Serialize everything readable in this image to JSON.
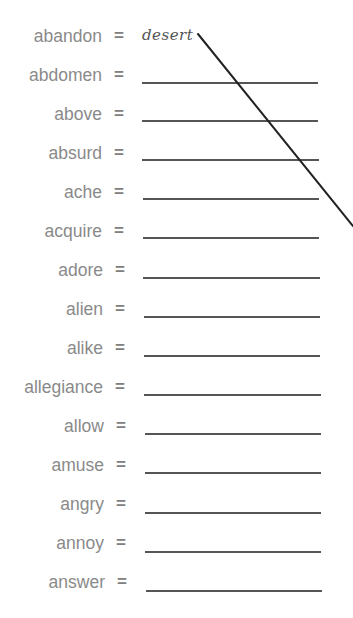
{
  "worksheet": {
    "title_cut": "",
    "separator": "=",
    "rows": [
      {
        "word": "abandon",
        "answer": "desert"
      },
      {
        "word": "abdomen",
        "answer": ""
      },
      {
        "word": "above",
        "answer": ""
      },
      {
        "word": "absurd",
        "answer": ""
      },
      {
        "word": "ache",
        "answer": ""
      },
      {
        "word": "acquire",
        "answer": ""
      },
      {
        "word": "adore",
        "answer": ""
      },
      {
        "word": "alien",
        "answer": ""
      },
      {
        "word": "alike",
        "answer": ""
      },
      {
        "word": "allegiance",
        "answer": ""
      },
      {
        "word": "allow",
        "answer": ""
      },
      {
        "word": "amuse",
        "answer": ""
      },
      {
        "word": "angry",
        "answer": ""
      },
      {
        "word": "annoy",
        "answer": ""
      },
      {
        "word": "answer",
        "answer": ""
      }
    ],
    "pen_stroke": {
      "description": "diagonal pen line drawn from end of 'desert' toward right edge",
      "x1": 198,
      "y1": 34,
      "x2": 353,
      "y2": 226,
      "color": "#222222"
    }
  }
}
